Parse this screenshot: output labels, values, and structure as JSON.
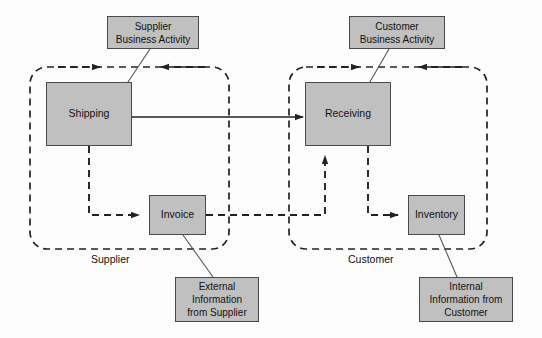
{
  "diagram": {
    "background_color": "#fdfdfd",
    "node_fill_color": "#c0c0c0",
    "node_border_color": "#4a4a4a",
    "line_color": "#222222",
    "nodes": [
      {
        "id": "shipping",
        "label": "Shipping",
        "x": 46,
        "y": 82,
        "w": 86,
        "h": 64
      },
      {
        "id": "receiving",
        "label": "Receiving",
        "x": 305,
        "y": 82,
        "w": 86,
        "h": 64
      },
      {
        "id": "invoice",
        "label": "Invoice",
        "x": 149,
        "y": 195,
        "w": 57,
        "h": 40
      },
      {
        "id": "inventory",
        "label": "Inventory",
        "x": 408,
        "y": 195,
        "w": 57,
        "h": 40
      }
    ],
    "callouts": [
      {
        "id": "supplier-business-activity",
        "label": "Supplier\nBusiness Activity",
        "x": 107,
        "y": 16,
        "w": 92,
        "h": 33
      },
      {
        "id": "customer-business-activity",
        "label": "Customer\nBusiness Activity",
        "x": 349,
        "y": 16,
        "w": 96,
        "h": 33
      },
      {
        "id": "external-information-from-supplier",
        "label": "External\nInformation\nfrom Supplier",
        "x": 175,
        "y": 277,
        "w": 84,
        "h": 45
      },
      {
        "id": "internal-information-from-customer",
        "label": "Internal\nInformation from\nCustomer",
        "x": 419,
        "y": 277,
        "w": 94,
        "h": 45
      }
    ],
    "lanes": [
      {
        "id": "supplier",
        "label": "Supplier",
        "x": 30,
        "y": 67,
        "w": 199,
        "h": 182,
        "label_x": 91,
        "label_y": 253
      },
      {
        "id": "customer",
        "label": "Customer",
        "x": 289,
        "y": 67,
        "w": 198,
        "h": 182,
        "label_x": 348,
        "label_y": 253
      }
    ],
    "connectors": [
      {
        "id": "shipping-to-receiving",
        "style": "solid",
        "from": "shipping",
        "to": "receiving"
      },
      {
        "id": "supplier-loop-in",
        "style": "dashed",
        "from": "supplier-lane-left",
        "to": "shipping-top"
      },
      {
        "id": "supplier-loop-return",
        "style": "dashed",
        "from": "supplier-lane-right",
        "to": "shipping-top-right"
      },
      {
        "id": "shipping-to-invoice",
        "style": "dashed",
        "from": "shipping-bottom",
        "to": "invoice-left"
      },
      {
        "id": "invoice-to-receiving",
        "style": "dashed",
        "from": "invoice-right",
        "to": "receiving-bottom"
      },
      {
        "id": "customer-loop-in",
        "style": "dashed",
        "from": "customer-lane-left",
        "to": "receiving-top"
      },
      {
        "id": "customer-loop-return",
        "style": "dashed",
        "from": "customer-lane-right",
        "to": "receiving-top-right"
      },
      {
        "id": "receiving-to-inventory",
        "style": "dashed",
        "from": "receiving-bottom-right",
        "to": "inventory-left"
      }
    ]
  }
}
